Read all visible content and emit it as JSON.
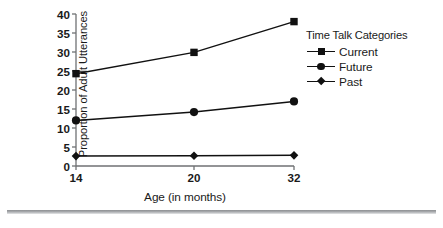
{
  "chart_data": {
    "type": "line",
    "title": "",
    "xlabel": "Age (in months)",
    "ylabel": "Proportion of Adult Utterances",
    "categories": [
      "14",
      "20",
      "32"
    ],
    "x": [
      14,
      20,
      32
    ],
    "xtick_labels": [
      "14",
      "20",
      "32"
    ],
    "ytick_labels": [
      "0",
      "5",
      "10",
      "15",
      "20",
      "25",
      "30",
      "35",
      "40"
    ],
    "yticks": [
      0,
      5,
      10,
      15,
      20,
      25,
      30,
      35,
      40
    ],
    "ylim": [
      0,
      40
    ],
    "grid": false,
    "legend_position": "right",
    "legend_title": "Time Talk Categories",
    "series": [
      {
        "name": "Current",
        "marker": "square",
        "color": "#111111",
        "values": [
          24.3,
          29.9,
          38.0
        ]
      },
      {
        "name": "Future",
        "marker": "circle",
        "color": "#111111",
        "values": [
          12.0,
          14.2,
          17.0
        ]
      },
      {
        "name": "Past",
        "marker": "diamond",
        "color": "#111111",
        "values": [
          2.6,
          2.7,
          2.8
        ]
      }
    ]
  },
  "axes": {
    "y_title": "Proportion of Adult Utterances",
    "x_title": "Age (in months)"
  },
  "legend": {
    "title": "Time Talk Categories",
    "items": [
      {
        "label": "Current",
        "marker": "square"
      },
      {
        "label": "Future",
        "marker": "circle"
      },
      {
        "label": "Past",
        "marker": "diamond"
      }
    ]
  },
  "style": {
    "axis_color": "#6f7173",
    "line_color": "#111111",
    "text_color": "#1a1a1a",
    "background": "#ffffff",
    "rule_color": "#9a9c9f"
  }
}
